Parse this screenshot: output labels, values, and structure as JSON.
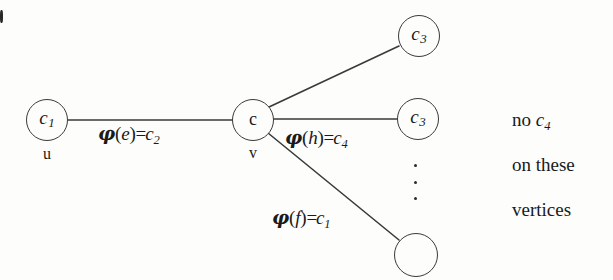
{
  "figure": {
    "background_color": "#fdfdfc",
    "stroke_color": "#3a3a3a",
    "text_color": "#1a1a1a"
  },
  "nodes": [
    {
      "id": "u",
      "color_label": "c",
      "color_index": "1",
      "vertex_name": "u",
      "cx": 47,
      "cy": 120,
      "r": 21
    },
    {
      "id": "v",
      "color_label": "c",
      "color_index": "",
      "vertex_name": "v",
      "cx": 253,
      "cy": 120,
      "r": 21
    },
    {
      "id": "w1",
      "color_label": "c",
      "color_index": "3",
      "vertex_name": "",
      "cx": 419,
      "cy": 36,
      "r": 21
    },
    {
      "id": "w2",
      "color_label": "c",
      "color_index": "3",
      "vertex_name": "",
      "cx": 418,
      "cy": 119,
      "r": 21
    },
    {
      "id": "w3",
      "color_label": "",
      "color_index": "",
      "vertex_name": "",
      "cx": 416,
      "cy": 255,
      "r": 22
    }
  ],
  "edges": [
    {
      "id": "e",
      "from": "u",
      "to": "v",
      "x1": 68,
      "y1": 120,
      "x2": 233,
      "y2": 120
    },
    {
      "id": "top",
      "from": "v",
      "to": "w1",
      "x1": 269,
      "y1": 107,
      "x2": 399,
      "y2": 46
    },
    {
      "id": "h",
      "from": "v",
      "to": "w2",
      "x1": 274,
      "y1": 119,
      "x2": 397,
      "y2": 119
    },
    {
      "id": "f",
      "from": "v",
      "to": "w3",
      "x1": 268,
      "y1": 133,
      "x2": 399,
      "y2": 240
    }
  ],
  "edge_labels": [
    {
      "id": "label-e",
      "phi": "φ",
      "open": "(",
      "var": "e",
      "close": ")",
      "eq": "=",
      "color": "c",
      "color_index": "2",
      "text": "φ(e)=c2",
      "x": 98,
      "y": 124
    },
    {
      "id": "label-h",
      "phi": "φ",
      "open": "(",
      "var": "h",
      "close": ")",
      "eq": "=",
      "color": "c",
      "color_index": "4",
      "text": "φ(h)=c4",
      "x": 285,
      "y": 128
    },
    {
      "id": "label-f",
      "phi": "φ",
      "open": "(",
      "var": "f",
      "close": ")",
      "eq": "=",
      "color": "c",
      "color_index": "1",
      "text": "φ(f)=c1",
      "x": 272,
      "y": 208
    }
  ],
  "ellipsis": {
    "id": "vertical-dots",
    "dot_count": 3,
    "x": 414,
    "y": 164,
    "height": 36
  },
  "side_note": {
    "lines": [
      {
        "prefix": "no ",
        "italic": "c",
        "sub": "4",
        "suffix": ""
      },
      {
        "prefix": "on these",
        "italic": "",
        "sub": "",
        "suffix": ""
      },
      {
        "prefix": "vertices",
        "italic": "",
        "sub": "",
        "suffix": ""
      }
    ],
    "line1_plain": "no",
    "line1_color": "c",
    "line1_index": "4",
    "line2": "on these",
    "line3": "vertices",
    "x": 512,
    "y1": 110,
    "y2": 155,
    "y3": 200
  }
}
